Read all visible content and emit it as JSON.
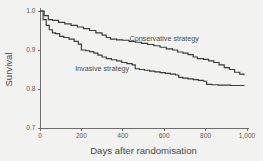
{
  "chart_data": {
    "type": "line",
    "title": "",
    "subtitle": "",
    "xlabel": "Days after randomisation",
    "ylabel": "Survival",
    "xlim": [
      0,
      1000
    ],
    "ylim": [
      0.7,
      1.0
    ],
    "xticks": [
      0,
      200,
      400,
      600,
      800,
      1000
    ],
    "xticklabels": [
      "0",
      "200",
      "400",
      "600",
      "800",
      "1,000"
    ],
    "yticks": [
      0.7,
      0.8,
      0.9,
      1.0
    ],
    "yticklabels": [
      "0.7",
      "0.8",
      "0.9",
      "1.0"
    ],
    "grid": false,
    "legend_position": "inline-annotation",
    "line_color": "#3a3a3a",
    "axis_color": "#6e6e6e",
    "background_color": "#f2f2f0",
    "annotations": [
      {
        "text": "Conservative strategy",
        "x": 600,
        "y": 0.923
      },
      {
        "text": "Invasive strategy",
        "x": 300,
        "y": 0.845
      }
    ],
    "series": [
      {
        "name": "Conservative strategy",
        "step": "post",
        "x": [
          0,
          20,
          40,
          60,
          90,
          120,
          150,
          180,
          210,
          240,
          270,
          300,
          320,
          340,
          370,
          400,
          430,
          460,
          490,
          520,
          550,
          580,
          610,
          640,
          665,
          690,
          715,
          740,
          760,
          790,
          815,
          840,
          865,
          890,
          915,
          940,
          965,
          985
        ],
        "y": [
          1.0,
          0.988,
          0.978,
          0.976,
          0.971,
          0.967,
          0.963,
          0.959,
          0.955,
          0.95,
          0.944,
          0.938,
          0.932,
          0.928,
          0.926,
          0.925,
          0.922,
          0.92,
          0.917,
          0.914,
          0.911,
          0.907,
          0.903,
          0.9,
          0.895,
          0.892,
          0.888,
          0.882,
          0.878,
          0.876,
          0.872,
          0.868,
          0.862,
          0.855,
          0.85,
          0.843,
          0.838,
          0.835
        ]
      },
      {
        "name": "Invasive strategy",
        "step": "post",
        "x": [
          0,
          15,
          30,
          45,
          60,
          75,
          95,
          115,
          140,
          165,
          185,
          200,
          220,
          240,
          260,
          280,
          300,
          320,
          345,
          370,
          395,
          420,
          445,
          460,
          480,
          505,
          530,
          555,
          580,
          605,
          630,
          655,
          670,
          690,
          715,
          740,
          765,
          790,
          805,
          830,
          860,
          890,
          920,
          950,
          985
        ],
        "y": [
          1.0,
          0.978,
          0.963,
          0.952,
          0.944,
          0.942,
          0.935,
          0.932,
          0.928,
          0.922,
          0.915,
          0.9,
          0.898,
          0.896,
          0.892,
          0.887,
          0.882,
          0.878,
          0.875,
          0.872,
          0.868,
          0.865,
          0.862,
          0.852,
          0.85,
          0.848,
          0.846,
          0.844,
          0.842,
          0.84,
          0.838,
          0.836,
          0.83,
          0.828,
          0.826,
          0.824,
          0.822,
          0.82,
          0.812,
          0.811,
          0.81,
          0.81,
          0.809,
          0.809,
          0.808
        ]
      }
    ]
  }
}
